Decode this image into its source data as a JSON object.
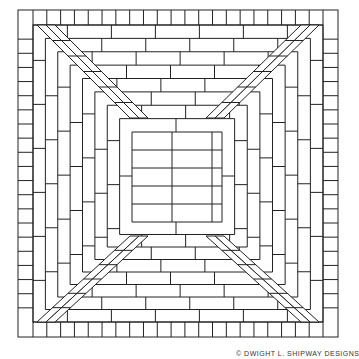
{
  "diagram": {
    "caption": "© DWIGHT L. SHIPWAY DESIGNS",
    "stroke_color": "#222222",
    "background": "#ffffff",
    "outer_border": {
      "description": "soldier course ring of short bricks around perimeter"
    },
    "diagonals": {
      "description": "double-brick diagonal bands from each corner to center square"
    },
    "center": {
      "description": "running bond center panel"
    }
  }
}
